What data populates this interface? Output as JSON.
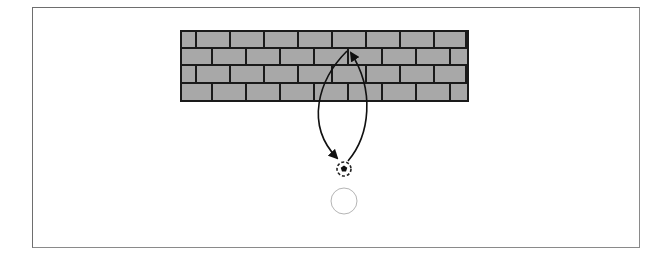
{
  "diagram": {
    "colors": {
      "frame": "#6e6e6e",
      "brick_fill": "#a8a8a8",
      "mortar": "#1a1a1a",
      "arrow": "#111111",
      "ball_outline": "#222222",
      "ghost_ball": "#b5b5b5"
    },
    "wall": {
      "x": 180,
      "y": 30,
      "width": 289,
      "height": 72,
      "rows": 4
    },
    "ball": {
      "cx": 344,
      "cy": 169,
      "r": 7
    },
    "ghost_ball": {
      "cx": 344,
      "cy": 201,
      "r": 13
    },
    "elements": [
      {
        "name": "brick-wall"
      },
      {
        "name": "outgoing-arrow"
      },
      {
        "name": "return-arrow"
      },
      {
        "name": "ball"
      },
      {
        "name": "ghost-ball"
      }
    ]
  }
}
